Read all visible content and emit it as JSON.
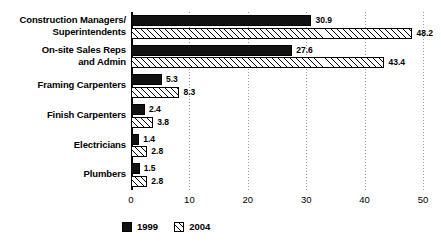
{
  "chart_data": {
    "type": "bar",
    "orientation": "horizontal",
    "title": "",
    "subtitle": "",
    "xlabel": "",
    "ylabel": "",
    "xlim": [
      0,
      50
    ],
    "xticks": [
      "0",
      "10",
      "20",
      "30",
      "40",
      "50"
    ],
    "grid": true,
    "legend_position": "bottom-left",
    "categories": [
      "Construction Managers/\nSuperintendents",
      "On-site Sales Reps\nand Admin",
      "Framing Carpenters",
      "Finish Carpenters",
      "Electricians",
      "Plumbers"
    ],
    "series": [
      {
        "name": "1999",
        "style": "solid-black",
        "color": "#111111",
        "values": [
          30.9,
          27.6,
          5.3,
          2.4,
          1.4,
          1.5
        ],
        "labels": [
          "30.9",
          "27.6",
          "5.3",
          "2.4",
          "1.4",
          "1.5"
        ]
      },
      {
        "name": "2004",
        "style": "diagonal-hatch",
        "color": "#ffffff",
        "values": [
          48.2,
          43.4,
          8.3,
          3.8,
          2.8,
          2.8
        ],
        "labels": [
          "48.2",
          "43.4",
          "8.3",
          "3.8",
          "2.8",
          "2.8"
        ]
      }
    ]
  },
  "legend": {
    "items": [
      {
        "label": "1999",
        "swatch": "solid-black-swatch"
      },
      {
        "label": "2004",
        "swatch": "hatched-white-swatch"
      }
    ]
  }
}
